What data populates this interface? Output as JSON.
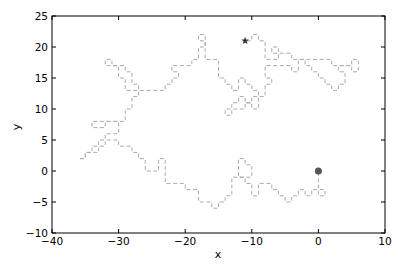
{
  "chart_data": {
    "type": "line",
    "title": "",
    "xlabel": "x",
    "ylabel": "y",
    "xlim": [
      -40,
      10
    ],
    "ylim": [
      -10,
      25
    ],
    "xticks": [
      -40,
      -30,
      -20,
      -10,
      0,
      10
    ],
    "yticks": [
      -10,
      -5,
      0,
      5,
      10,
      15,
      20,
      25
    ],
    "xtick_labels": [
      "−40",
      "−30",
      "−20",
      "−10",
      "0",
      "10"
    ],
    "ytick_labels": [
      "−10",
      "−5",
      "0",
      "5",
      "10",
      "15",
      "20",
      "25"
    ],
    "grid": false,
    "legend": null,
    "series": [
      {
        "name": "random walk",
        "style": "dashed unit steps",
        "color": "#aaaaaa",
        "points": [
          [
            0,
            0
          ],
          [
            0,
            -1
          ],
          [
            0,
            -2
          ],
          [
            0,
            -3
          ],
          [
            0,
            -4
          ],
          [
            1,
            -4
          ],
          [
            1,
            -3
          ],
          [
            0,
            -3
          ],
          [
            -1,
            -3
          ],
          [
            -1,
            -4
          ],
          [
            -2,
            -4
          ],
          [
            -2,
            -3
          ],
          [
            -3,
            -3
          ],
          [
            -3,
            -4
          ],
          [
            -4,
            -4
          ],
          [
            -4,
            -5
          ],
          [
            -5,
            -5
          ],
          [
            -5,
            -4
          ],
          [
            -6,
            -4
          ],
          [
            -6,
            -3
          ],
          [
            -7,
            -3
          ],
          [
            -7,
            -2
          ],
          [
            -8,
            -2
          ],
          [
            -9,
            -2
          ],
          [
            -9,
            -3
          ],
          [
            -9,
            -4
          ],
          [
            -10,
            -4
          ],
          [
            -10,
            -3
          ],
          [
            -10,
            -2
          ],
          [
            -11,
            -2
          ],
          [
            -11,
            -1
          ],
          [
            -12,
            -1
          ],
          [
            -12,
            0
          ],
          [
            -12,
            1
          ],
          [
            -12,
            2
          ],
          [
            -11,
            2
          ],
          [
            -11,
            1
          ],
          [
            -10,
            1
          ],
          [
            -10,
            0
          ],
          [
            -10,
            -1
          ],
          [
            -11,
            -1
          ],
          [
            -12,
            -1
          ],
          [
            -13,
            -1
          ],
          [
            -13,
            -2
          ],
          [
            -13,
            -3
          ],
          [
            -13,
            -4
          ],
          [
            -14,
            -4
          ],
          [
            -14,
            -5
          ],
          [
            -15,
            -5
          ],
          [
            -15,
            -6
          ],
          [
            -16,
            -6
          ],
          [
            -16,
            -5
          ],
          [
            -17,
            -5
          ],
          [
            -18,
            -5
          ],
          [
            -18,
            -4
          ],
          [
            -18,
            -3
          ],
          [
            -19,
            -3
          ],
          [
            -20,
            -3
          ],
          [
            -20,
            -2
          ],
          [
            -21,
            -2
          ],
          [
            -22,
            -2
          ],
          [
            -23,
            -2
          ],
          [
            -23,
            -1
          ],
          [
            -23,
            0
          ],
          [
            -23,
            1
          ],
          [
            -23,
            2
          ],
          [
            -24,
            2
          ],
          [
            -24,
            1
          ],
          [
            -24,
            0
          ],
          [
            -25,
            0
          ],
          [
            -26,
            0
          ],
          [
            -26,
            1
          ],
          [
            -26,
            2
          ],
          [
            -27,
            2
          ],
          [
            -27,
            3
          ],
          [
            -28,
            3
          ],
          [
            -28,
            4
          ],
          [
            -29,
            4
          ],
          [
            -30,
            4
          ],
          [
            -30,
            5
          ],
          [
            -31,
            5
          ],
          [
            -32,
            5
          ],
          [
            -32,
            4
          ],
          [
            -33,
            4
          ],
          [
            -33,
            3
          ],
          [
            -34,
            3
          ],
          [
            -35,
            3
          ],
          [
            -35,
            2
          ],
          [
            -36,
            2
          ],
          [
            -35,
            2
          ],
          [
            -35,
            3
          ],
          [
            -34,
            3
          ],
          [
            -34,
            4
          ],
          [
            -33,
            4
          ],
          [
            -33,
            5
          ],
          [
            -32,
            5
          ],
          [
            -32,
            6
          ],
          [
            -31,
            6
          ],
          [
            -30,
            6
          ],
          [
            -30,
            7
          ],
          [
            -30,
            8
          ],
          [
            -31,
            8
          ],
          [
            -32,
            8
          ],
          [
            -32,
            7
          ],
          [
            -33,
            7
          ],
          [
            -34,
            7
          ],
          [
            -34,
            8
          ],
          [
            -33,
            8
          ],
          [
            -32,
            8
          ],
          [
            -31,
            8
          ],
          [
            -30,
            8
          ],
          [
            -29,
            8
          ],
          [
            -29,
            9
          ],
          [
            -29,
            10
          ],
          [
            -28,
            10
          ],
          [
            -28,
            11
          ],
          [
            -28,
            12
          ],
          [
            -27,
            12
          ],
          [
            -27,
            13
          ],
          [
            -28,
            13
          ],
          [
            -29,
            13
          ],
          [
            -29,
            14
          ],
          [
            -29,
            15
          ],
          [
            -30,
            15
          ],
          [
            -30,
            16
          ],
          [
            -30,
            17
          ],
          [
            -31,
            17
          ],
          [
            -31,
            18
          ],
          [
            -32,
            18
          ],
          [
            -32,
            17
          ],
          [
            -31,
            17
          ],
          [
            -30,
            17
          ],
          [
            -29,
            17
          ],
          [
            -29,
            16
          ],
          [
            -28,
            16
          ],
          [
            -28,
            15
          ],
          [
            -28,
            14
          ],
          [
            -27,
            14
          ],
          [
            -27,
            13
          ],
          [
            -26,
            13
          ],
          [
            -25,
            13
          ],
          [
            -24,
            13
          ],
          [
            -23,
            13
          ],
          [
            -23,
            14
          ],
          [
            -22,
            14
          ],
          [
            -22,
            15
          ],
          [
            -21,
            15
          ],
          [
            -21,
            16
          ],
          [
            -22,
            16
          ],
          [
            -22,
            17
          ],
          [
            -21,
            17
          ],
          [
            -20,
            17
          ],
          [
            -19,
            17
          ],
          [
            -19,
            18
          ],
          [
            -18,
            18
          ],
          [
            -18,
            19
          ],
          [
            -18,
            20
          ],
          [
            -17,
            20
          ],
          [
            -17,
            21
          ],
          [
            -17,
            22
          ],
          [
            -18,
            22
          ],
          [
            -18,
            21
          ],
          [
            -17,
            21
          ],
          [
            -17,
            20
          ],
          [
            -17,
            19
          ],
          [
            -17,
            18
          ],
          [
            -16,
            18
          ],
          [
            -15,
            18
          ],
          [
            -15,
            17
          ],
          [
            -15,
            16
          ],
          [
            -15,
            15
          ],
          [
            -14,
            15
          ],
          [
            -14,
            14
          ],
          [
            -13,
            14
          ],
          [
            -13,
            13
          ],
          [
            -12,
            13
          ],
          [
            -12,
            14
          ],
          [
            -12,
            15
          ],
          [
            -11,
            15
          ],
          [
            -11,
            14
          ],
          [
            -10,
            14
          ],
          [
            -10,
            13
          ],
          [
            -9,
            13
          ],
          [
            -9,
            12
          ],
          [
            -9,
            11
          ],
          [
            -9,
            10
          ],
          [
            -10,
            10
          ],
          [
            -10,
            11
          ],
          [
            -11,
            11
          ],
          [
            -11,
            12
          ],
          [
            -12,
            12
          ],
          [
            -12,
            11
          ],
          [
            -13,
            11
          ],
          [
            -13,
            10
          ],
          [
            -14,
            10
          ],
          [
            -14,
            9
          ],
          [
            -13,
            9
          ],
          [
            -13,
            10
          ],
          [
            -12,
            10
          ],
          [
            -11,
            10
          ],
          [
            -11,
            11
          ],
          [
            -10,
            11
          ],
          [
            -10,
            12
          ],
          [
            -9,
            12
          ],
          [
            -8,
            12
          ],
          [
            -8,
            13
          ],
          [
            -8,
            14
          ],
          [
            -7,
            14
          ],
          [
            -7,
            15
          ],
          [
            -8,
            15
          ],
          [
            -8,
            16
          ],
          [
            -8,
            17
          ],
          [
            -7,
            17
          ],
          [
            -6,
            17
          ],
          [
            -5,
            17
          ],
          [
            -4,
            17
          ],
          [
            -4,
            16
          ],
          [
            -3,
            16
          ],
          [
            -3,
            17
          ],
          [
            -3,
            18
          ],
          [
            -2,
            18
          ],
          [
            -2,
            17
          ],
          [
            -1,
            17
          ],
          [
            -1,
            16
          ],
          [
            0,
            16
          ],
          [
            0,
            15
          ],
          [
            1,
            15
          ],
          [
            1,
            14
          ],
          [
            2,
            14
          ],
          [
            2,
            13
          ],
          [
            3,
            13
          ],
          [
            3,
            14
          ],
          [
            4,
            14
          ],
          [
            4,
            15
          ],
          [
            4,
            16
          ],
          [
            3,
            16
          ],
          [
            3,
            17
          ],
          [
            4,
            17
          ],
          [
            5,
            17
          ],
          [
            5,
            18
          ],
          [
            6,
            18
          ],
          [
            6,
            17
          ],
          [
            6,
            16
          ],
          [
            5,
            16
          ],
          [
            5,
            17
          ],
          [
            4,
            17
          ],
          [
            3,
            17
          ],
          [
            2,
            17
          ],
          [
            2,
            18
          ],
          [
            1,
            18
          ],
          [
            0,
            18
          ],
          [
            -1,
            18
          ],
          [
            -2,
            18
          ],
          [
            -3,
            18
          ],
          [
            -4,
            18
          ],
          [
            -4,
            19
          ],
          [
            -5,
            19
          ],
          [
            -6,
            19
          ],
          [
            -6,
            20
          ],
          [
            -7,
            20
          ],
          [
            -7,
            19
          ],
          [
            -6,
            19
          ],
          [
            -6,
            18
          ],
          [
            -7,
            18
          ],
          [
            -8,
            18
          ],
          [
            -8,
            19
          ],
          [
            -8,
            20
          ],
          [
            -8,
            21
          ],
          [
            -9,
            21
          ],
          [
            -9,
            22
          ],
          [
            -10,
            22
          ],
          [
            -10,
            21
          ],
          [
            -11,
            21
          ]
        ]
      }
    ],
    "markers": [
      {
        "name": "start",
        "shape": "circle",
        "x": 0,
        "y": 0,
        "color": "#555555"
      },
      {
        "name": "end",
        "shape": "star",
        "x": -11,
        "y": 21,
        "color": "#333333"
      }
    ]
  }
}
